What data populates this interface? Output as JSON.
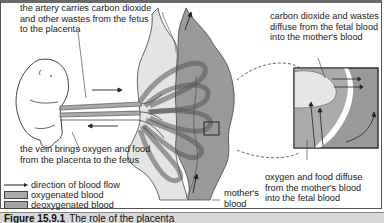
{
  "labels": {
    "artery": "the artery carries carbon dioxide\nand other wastes from the fetus\nto the placenta",
    "co2_diffuse": "carbon dioxide and wastes\ndiffuse from the fetal blood\ninto the mother's blood",
    "vein": "the vein brings oxygen and food\nfrom the placenta to the fetus",
    "o2_diffuse": "oxygen and food diffuse\nfrom the mother's blood\ninto the fetal blood",
    "mothers_blood": "mother's\nblood"
  },
  "legend": {
    "flow": "direction of blood flow",
    "oxygenated": "oxygenated blood",
    "deoxygenated": "deoxygenated blood"
  },
  "caption": {
    "figure_number": "Figure 15.9.1",
    "text": "The role of the placenta"
  },
  "colors": {
    "oxygenated": "#a9a9a9",
    "deoxygenated": "#a3a3a3",
    "maternal_tissue": "#9a9a9a",
    "placenta_light": "#e4e4e4",
    "outline": "#444444"
  }
}
